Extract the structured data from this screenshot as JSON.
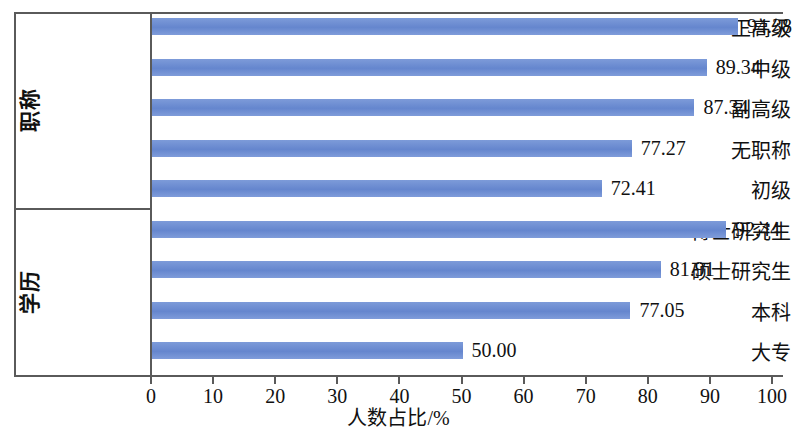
{
  "chart_data": {
    "type": "bar",
    "orientation": "horizontal",
    "title": "",
    "xlabel": "人数占比/%",
    "ylabel": "",
    "xlim": [
      0,
      100
    ],
    "xticks": [
      "0",
      "10",
      "20",
      "30",
      "40",
      "50",
      "60",
      "70",
      "80",
      "90",
      "100"
    ],
    "grid": false,
    "legend": null,
    "bar_color": "#6d8ed4",
    "value_label_format": "2 decimals",
    "groups": [
      {
        "group_label": "职称",
        "categories": [
          "正高级",
          "中级",
          "副高级",
          "无职称",
          "初级"
        ],
        "values": [
          94.38,
          89.34,
          87.34,
          77.27,
          72.41
        ],
        "value_labels": [
          "94.38",
          "89.34",
          "87.34",
          "77.27",
          "72.41"
        ]
      },
      {
        "group_label": "学历",
        "categories": [
          "博士研究生",
          "硕士研究生",
          "本科",
          "大专"
        ],
        "values": [
          92.44,
          81.91,
          77.05,
          50.0
        ],
        "value_labels": [
          "92.44",
          "81.91",
          "77.05",
          "50.00"
        ]
      }
    ],
    "categories": [
      "正高级",
      "中级",
      "副高级",
      "无职称",
      "初级",
      "博士研究生",
      "硕士研究生",
      "本科",
      "大专"
    ],
    "values": [
      94.38,
      89.34,
      87.34,
      77.27,
      72.41,
      92.44,
      81.91,
      77.05,
      50.0
    ]
  }
}
